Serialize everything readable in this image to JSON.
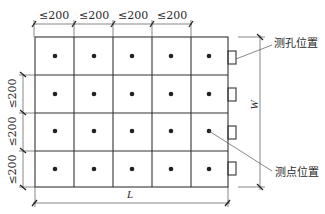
{
  "diagram": {
    "grid": {
      "columns": 5,
      "rows": 4,
      "col_x": [
        35,
        74,
        113,
        152,
        191,
        228
      ],
      "row_y": [
        37,
        75,
        113,
        151,
        187
      ],
      "line_color": "#333333",
      "dot_color": "#222222"
    },
    "top_dimensions": [
      "≤200",
      "≤200",
      "≤200",
      "≤200"
    ],
    "left_dimensions": [
      "≤200",
      "≤200",
      "≤200"
    ],
    "length_label": "L",
    "width_label": "W",
    "hole_count": 4,
    "callouts": {
      "hole_position": "测孔位置",
      "point_position": "测点位置"
    }
  }
}
